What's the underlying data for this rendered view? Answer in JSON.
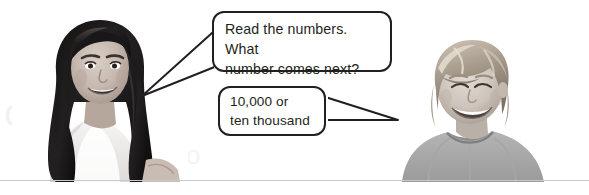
{
  "page": {
    "background_color": "#ffffff",
    "rule_color": "#c9c9c9",
    "ink_color": "#231f20"
  },
  "watermarks": [
    {
      "text": "hmhco",
      "color": "#e6e6e6"
    },
    {
      "text": "C",
      "color": "#f1f1f1"
    },
    {
      "text": "o",
      "color": "#f4f4f4"
    }
  ],
  "speech_bubbles": [
    {
      "id": "question",
      "speaker": "girl",
      "tail_direction": "left",
      "lines": [
        "Read the numbers. What",
        "number comes next?"
      ],
      "line1": "Read the numbers. What",
      "line2": "number comes next?"
    },
    {
      "id": "answer",
      "speaker": "boy",
      "tail_direction": "right",
      "lines": [
        "10,000 or",
        "ten thousand"
      ],
      "line1": "10,000 or",
      "line2": "ten thousand"
    }
  ],
  "photos": [
    {
      "id": "girl",
      "alt": "Smiling girl with long dark hair in a white top",
      "position": "left",
      "grayscale": true
    },
    {
      "id": "boy",
      "alt": "Smiling boy with light blond hair in a gray t-shirt",
      "position": "right",
      "grayscale": true
    }
  ]
}
